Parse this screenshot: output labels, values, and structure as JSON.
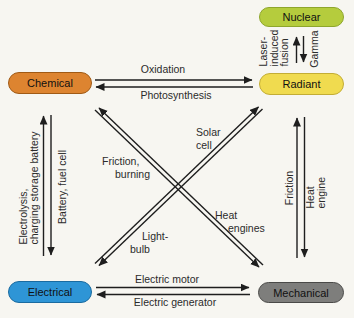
{
  "diagram_title": "Energy transformation diagram",
  "nodes": {
    "nuclear": {
      "label": "Nuclear",
      "fill": "#b5cc3d",
      "border": "#8ea62c"
    },
    "radiant": {
      "label": "Radiant",
      "fill": "#f0db4f",
      "border": "#c3ad35"
    },
    "chemical": {
      "label": "Chemical",
      "fill": "#dd8430",
      "border": "#a05a15"
    },
    "electrical": {
      "label": "Electrical",
      "fill": "#2e95d6",
      "border": "#1a6ba0"
    },
    "mechanical": {
      "label": "Mechanical",
      "fill": "#7e7e7c",
      "border": "#4a4a48"
    }
  },
  "labels": {
    "oxidation": "Oxidation",
    "photosynthesis": "Photosynthesis",
    "laser_induced_fusion": "Laser-\ninduced\nfusion",
    "gamma": "Gamma",
    "electrolysis_charging": "Electrolysis,\ncharging storage battery",
    "battery_fuel_cell": "Battery, fuel cell",
    "friction": "Friction",
    "heat_engine": "Heat engine",
    "solar_cell": [
      "Solar",
      "cell"
    ],
    "friction_burning": [
      "Friction,",
      "burning"
    ],
    "heat_engines": [
      "Heat",
      "engines"
    ],
    "light_bulb": [
      "Light-",
      "bulb"
    ],
    "electric_motor": "Electric motor",
    "electric_generator": "Electric generator"
  },
  "edges": [
    {
      "from": "chemical",
      "to": "radiant",
      "label": "Oxidation"
    },
    {
      "from": "radiant",
      "to": "chemical",
      "label": "Photosynthesis"
    },
    {
      "from": "radiant",
      "to": "nuclear",
      "label": "Laser-induced fusion"
    },
    {
      "from": "nuclear",
      "to": "radiant",
      "label": "Gamma"
    },
    {
      "from": "electrical",
      "to": "chemical",
      "label": "Electrolysis, charging storage battery"
    },
    {
      "from": "chemical",
      "to": "electrical",
      "label": "Battery, fuel cell"
    },
    {
      "from": "mechanical",
      "to": "radiant",
      "label": "Friction"
    },
    {
      "from": "radiant",
      "to": "mechanical",
      "label": "Heat engine"
    },
    {
      "from": "radiant",
      "to": "electrical",
      "label": "Solar cell"
    },
    {
      "from": "electrical",
      "to": "radiant",
      "label": "Light-bulb"
    },
    {
      "from": "mechanical",
      "to": "chemical",
      "label": "Friction, burning"
    },
    {
      "from": "chemical",
      "to": "mechanical",
      "label": "Heat engines"
    },
    {
      "from": "electrical",
      "to": "mechanical",
      "label": "Electric motor"
    },
    {
      "from": "mechanical",
      "to": "electrical",
      "label": "Electric generator"
    }
  ],
  "arrow_color": "#1e1e1e",
  "background_color": "#f7f6f1"
}
